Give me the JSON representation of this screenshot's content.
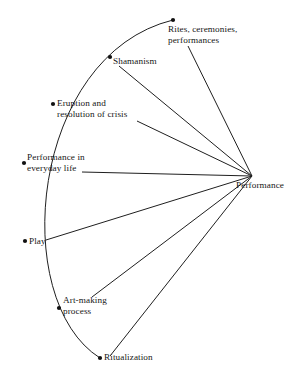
{
  "diagram": {
    "type": "fan-arc-diagram",
    "stroke_color": "#1f1f1f",
    "dot_color": "#111111",
    "background_color": "#ffffff",
    "hub": {
      "label": "Performance",
      "x": 252,
      "y": 176,
      "label_x": 236,
      "label_y": 180
    },
    "arc": {
      "start_x": 173,
      "start_y": 20,
      "end_x": 100,
      "end_y": 358,
      "control1_x": 30,
      "control1_y": 55,
      "control2_x": 8,
      "control2_y": 300
    },
    "nodes": [
      {
        "id": "rites",
        "label": "Rites, ceremonies,\nperformances",
        "dot_x": 173,
        "dot_y": 20,
        "label_x": 168,
        "label_y": 24,
        "line_x": 188,
        "line_y": 46
      },
      {
        "id": "shamanism",
        "label": "Shamanism",
        "dot_x": 110,
        "dot_y": 57,
        "label_x": 113,
        "label_y": 56,
        "line_x": 119,
        "line_y": 66
      },
      {
        "id": "eruption",
        "label": "Eruption and\nresolution of crisis",
        "dot_x": 53,
        "dot_y": 104,
        "label_x": 57,
        "label_y": 98,
        "line_x": 137,
        "line_y": 121
      },
      {
        "id": "everyday",
        "label": "Performance in\neveryday life",
        "dot_x": 24,
        "dot_y": 163,
        "label_x": 27,
        "label_y": 152,
        "line_x": 82,
        "line_y": 172
      },
      {
        "id": "play",
        "label": "Play",
        "dot_x": 25,
        "dot_y": 241,
        "label_x": 29,
        "label_y": 236,
        "line_x": 46,
        "line_y": 240
      },
      {
        "id": "artmaking",
        "label": "Art-making\nprocess",
        "dot_x": 59,
        "dot_y": 308,
        "label_x": 63,
        "label_y": 295,
        "line_x": 92,
        "line_y": 297
      },
      {
        "id": "ritualization",
        "label": "Ritualization",
        "dot_x": 100,
        "dot_y": 358,
        "label_x": 104,
        "label_y": 352,
        "line_x": 110,
        "line_y": 356
      }
    ]
  }
}
